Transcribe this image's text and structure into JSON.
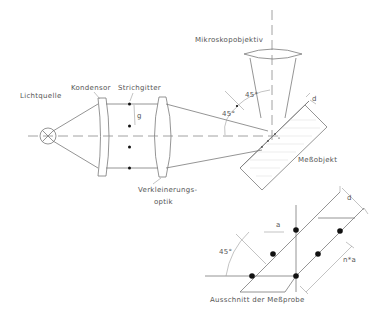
{
  "figure": {
    "type": "optical-setup-schematic",
    "labels": {
      "light_source": "Lichtquelle",
      "condenser": "Kondensor",
      "grating": "Strichgitter",
      "grating_period": "g",
      "reduction_optics_line1": "Verkleinerungs-",
      "reduction_optics_line2": "optik",
      "microscope_objective": "Mikroskopobjektiv",
      "measurement_object": "Meßobjekt",
      "thickness": "d",
      "angle_upper": "45°",
      "angle_lower": "45°"
    },
    "detail": {
      "caption": "Ausschnitt der Meßprobe",
      "spacing": "a",
      "thickness": "d",
      "multiple_spacing": "n*a",
      "angle": "45°"
    },
    "colors": {
      "line": "#7a7a7a",
      "text": "#555555",
      "dot": "#111111",
      "background": "#ffffff"
    }
  }
}
